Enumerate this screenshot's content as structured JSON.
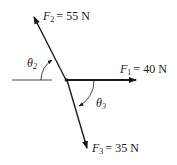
{
  "diagram": {
    "type": "force-vector-diagram",
    "forces": [
      {
        "name": "F",
        "subscript": "1",
        "equals": "=",
        "value": "40 N"
      },
      {
        "name": "F",
        "subscript": "2",
        "equals": "=",
        "value": "55 N"
      },
      {
        "name": "F",
        "subscript": "3",
        "equals": "=",
        "value": "35 N"
      }
    ],
    "angles": [
      {
        "symbol": "θ",
        "subscript": "2"
      },
      {
        "symbol": "θ",
        "subscript": "3"
      }
    ],
    "colors": {
      "line": "#1a1a1a",
      "background": "#ffffff"
    }
  }
}
